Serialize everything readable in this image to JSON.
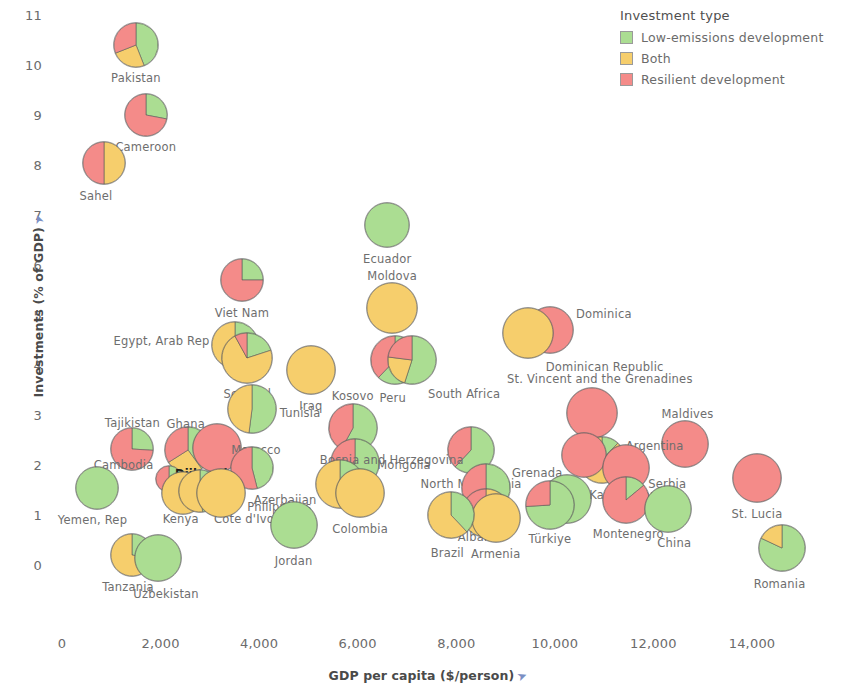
{
  "legend": {
    "title": "Investment type",
    "items": [
      {
        "label": "Low-emissions development",
        "color": "#abdd92",
        "key": "low"
      },
      {
        "label": "Both",
        "color": "#f6ce6c",
        "key": "both"
      },
      {
        "label": "Resilient development",
        "color": "#f48b89",
        "key": "resilient"
      }
    ]
  },
  "chart_data": {
    "type": "scatter",
    "marker": "pie",
    "title": "",
    "xlabel": "GDP per capita ($/person)",
    "ylabel": "Investments (% of GDP)",
    "xlim": [
      0,
      15200
    ],
    "ylim": [
      -0.45,
      11.3
    ],
    "xticks": [
      0,
      2000,
      4000,
      6000,
      8000,
      10000,
      12000,
      14000
    ],
    "xtick_labels": [
      "0",
      "2,000",
      "4,000",
      "6,000",
      "8,000",
      "10,000",
      "12,000",
      "14,000"
    ],
    "yticks": [
      0,
      1,
      2,
      3,
      4,
      5,
      6,
      7,
      8,
      9,
      10,
      11
    ],
    "ytick_labels": [
      "0",
      "1",
      "2",
      "3",
      "4",
      "5",
      "6",
      "7",
      "8",
      "9",
      "10",
      "11"
    ],
    "grid": false,
    "legend_position": "top-right",
    "slice_keys": [
      "low",
      "both",
      "resilient"
    ],
    "points": [
      {
        "name": "Pakistan",
        "x": 1500,
        "y": 10.4,
        "r": 23,
        "slices": {
          "low": 0.44,
          "both": 0.25,
          "resilient": 0.31
        },
        "label_dx": 0,
        "label_dy": 33,
        "align": "center"
      },
      {
        "name": "Cameroon",
        "x": 1700,
        "y": 9.0,
        "r": 22,
        "slices": {
          "low": 0.28,
          "both": 0.0,
          "resilient": 0.72
        },
        "label_dx": 0,
        "label_dy": 32,
        "align": "center"
      },
      {
        "name": "Sahel",
        "x": 850,
        "y": 8.05,
        "r": 22,
        "slices": {
          "low": 0.0,
          "both": 0.5,
          "resilient": 0.5
        },
        "label_dx": -8,
        "label_dy": 33,
        "align": "center"
      },
      {
        "name": "Ecuador",
        "x": 6600,
        "y": 6.8,
        "r": 23,
        "slices": {
          "low": 1.0,
          "both": 0.0,
          "resilient": 0.0
        },
        "label_dx": 0,
        "label_dy": 34,
        "align": "center"
      },
      {
        "name": "Viet Nam",
        "x": 3650,
        "y": 5.7,
        "r": 22,
        "slices": {
          "low": 0.25,
          "both": 0.0,
          "resilient": 0.75
        },
        "label_dx": 0,
        "label_dy": 33,
        "align": "center"
      },
      {
        "name": "Moldova",
        "x": 6700,
        "y": 5.15,
        "r": 26,
        "slices": {
          "low": 0.0,
          "both": 1.0,
          "resilient": 0.0
        },
        "label_dx": 0,
        "label_dy": -32,
        "align": "center"
      },
      {
        "name": "Dominica",
        "x": 9900,
        "y": 4.7,
        "r": 24,
        "slices": {
          "low": 0.0,
          "both": 0.0,
          "resilient": 1.0
        },
        "label_dx": 26,
        "label_dy": -16,
        "align": "left"
      },
      {
        "name": "Dominican Republic",
        "x": 9450,
        "y": 4.65,
        "r": 26,
        "slices": {
          "low": 0.0,
          "both": 1.0,
          "resilient": 0.0
        },
        "label_dx": 18,
        "label_dy": 34,
        "align": "left"
      },
      {
        "name": "Egypt, Arab Rep",
        "x": 3520,
        "y": 4.4,
        "r": 24,
        "slices": {
          "low": 0.22,
          "both": 0.78,
          "resilient": 0.0
        },
        "label_dx": -26,
        "label_dy": -4,
        "align": "right"
      },
      {
        "name": "Senegal",
        "x": 3760,
        "y": 4.15,
        "r": 26,
        "slices": {
          "low": 0.2,
          "both": 0.72,
          "resilient": 0.08
        },
        "label_dx": 0,
        "label_dy": 36,
        "align": "center"
      },
      {
        "name": "Peru",
        "x": 6750,
        "y": 4.1,
        "r": 25,
        "slices": {
          "low": 0.62,
          "both": 0.0,
          "resilient": 0.38
        },
        "label_dx": -2,
        "label_dy": 38,
        "align": "center"
      },
      {
        "name": "South Africa",
        "x": 7100,
        "y": 4.1,
        "r": 25,
        "slices": {
          "low": 0.55,
          "both": 0.22,
          "resilient": 0.23
        },
        "label_dx": 16,
        "label_dy": 34,
        "align": "left"
      },
      {
        "name": "Iraq",
        "x": 5050,
        "y": 3.9,
        "r": 25,
        "slices": {
          "low": 0.0,
          "both": 1.0,
          "resilient": 0.0
        },
        "label_dx": 0,
        "label_dy": 36,
        "align": "center"
      },
      {
        "name": "St. Vincent and the Grenadines",
        "x": 10750,
        "y": 3.05,
        "r": 26,
        "slices": {
          "low": 0.0,
          "both": 0.0,
          "resilient": 1.0
        },
        "label_dx": 8,
        "label_dy": -34,
        "align": "center"
      },
      {
        "name": "Tunisia",
        "x": 3850,
        "y": 3.12,
        "r": 25,
        "slices": {
          "low": 0.52,
          "both": 0.48,
          "resilient": 0.0
        },
        "label_dx": 28,
        "label_dy": 4,
        "align": "left"
      },
      {
        "name": "Kosovo",
        "x": 5900,
        "y": 2.75,
        "r": 25,
        "slices": {
          "low": 0.58,
          "both": 0.0,
          "resilient": 0.42
        },
        "label_dx": 0,
        "label_dy": -32,
        "align": "center"
      },
      {
        "name": "Tajikistan",
        "x": 1430,
        "y": 2.32,
        "r": 22,
        "slices": {
          "low": 0.26,
          "both": 0.0,
          "resilient": 0.74
        },
        "label_dx": 0,
        "label_dy": -26,
        "align": "center"
      },
      {
        "name": "Ghana",
        "x": 2550,
        "y": 2.3,
        "r": 24,
        "slices": {
          "low": 0.4,
          "both": 0.26,
          "resilient": 0.34
        },
        "label_dx": -2,
        "label_dy": -26,
        "align": "center"
      },
      {
        "name": "Morocco",
        "x": 3150,
        "y": 2.35,
        "r": 25,
        "slices": {
          "low": 0.0,
          "both": 0.0,
          "resilient": 1.0
        },
        "label_dx": 14,
        "label_dy": 2,
        "align": "left"
      },
      {
        "name": "Maldives",
        "x": 12650,
        "y": 2.43,
        "r": 24,
        "slices": {
          "low": 0.0,
          "both": 0.0,
          "resilient": 1.0
        },
        "label_dx": 2,
        "label_dy": -30,
        "align": "center"
      },
      {
        "name": "Argentina",
        "x": 10950,
        "y": 2.1,
        "r": 24,
        "slices": {
          "low": 0.12,
          "both": 0.88,
          "resilient": 0.0
        },
        "label_dx": 24,
        "label_dy": -14,
        "align": "left"
      },
      {
        "name": "Grenada",
        "x": 10600,
        "y": 2.2,
        "r": 23,
        "slices": {
          "low": 0.0,
          "both": 0.0,
          "resilient": 1.0
        },
        "label_dx": -22,
        "label_dy": 18,
        "align": "right"
      },
      {
        "name": "North Macedonia",
        "x": 8300,
        "y": 2.3,
        "r": 24,
        "slices": {
          "low": 0.62,
          "both": 0.0,
          "resilient": 0.38
        },
        "label_dx": 0,
        "label_dy": 34,
        "align": "center"
      },
      {
        "name": "Serbia",
        "x": 11450,
        "y": 1.95,
        "r": 24,
        "slices": {
          "low": 0.0,
          "both": 0.0,
          "resilient": 1.0
        },
        "label_dx": 22,
        "label_dy": 16,
        "align": "left"
      },
      {
        "name": "Cambodia",
        "x": 2180,
        "y": 1.73,
        "r": 14,
        "slices": {
          "low": 0.3,
          "both": 0.22,
          "resilient": 0.48
        },
        "label_dx": -16,
        "label_dy": -14,
        "align": "right"
      },
      {
        "name": "Djibouti",
        "x": 3850,
        "y": 1.95,
        "r": 22,
        "slices": {
          "low": 0.46,
          "both": 0.0,
          "resilient": 0.54
        },
        "label_dx": -24,
        "label_dy": 6,
        "align": "right"
      },
      {
        "name": "Mongolia",
        "x": 5950,
        "y": 2.05,
        "r": 25,
        "slices": {
          "low": 0.58,
          "both": 0.18,
          "resilient": 0.24
        },
        "label_dx": 22,
        "label_dy": 2,
        "align": "left"
      },
      {
        "name": "St. Lucia",
        "x": 14100,
        "y": 1.75,
        "r": 25,
        "slices": {
          "low": 0.0,
          "both": 0.0,
          "resilient": 1.0
        },
        "label_dx": 0,
        "label_dy": 36,
        "align": "center"
      },
      {
        "name": "Bosnia and Herzegovina",
        "x": 8600,
        "y": 1.55,
        "r": 25,
        "slices": {
          "low": 0.44,
          "both": 0.0,
          "resilient": 0.56
        },
        "label_dx": -22,
        "label_dy": -28,
        "align": "right"
      },
      {
        "name": "Azerbaijan",
        "x": 5650,
        "y": 1.62,
        "r": 25,
        "slices": {
          "low": 0.28,
          "both": 0.72,
          "resilient": 0.0
        },
        "label_dx": -24,
        "label_dy": 16,
        "align": "right"
      },
      {
        "name": "Kenya",
        "x": 2450,
        "y": 1.45,
        "r": 22,
        "slices": {
          "low": 0.0,
          "both": 1.0,
          "resilient": 0.0
        },
        "label_dx": -2,
        "label_dy": 26,
        "align": "center"
      },
      {
        "name": "Côte d'Ivoire",
        "x": 2800,
        "y": 1.48,
        "r": 22,
        "slices": {
          "low": 0.48,
          "both": 0.52,
          "resilient": 0.0
        },
        "label_dx": 14,
        "label_dy": 28,
        "align": "left"
      },
      {
        "name": "Philippines",
        "x": 3230,
        "y": 1.45,
        "r": 25,
        "slices": {
          "low": 0.0,
          "both": 1.0,
          "resilient": 0.0
        },
        "label_dx": 26,
        "label_dy": 14,
        "align": "left"
      },
      {
        "name": "Yemen, Rep",
        "x": 700,
        "y": 1.55,
        "r": 22,
        "slices": {
          "low": 1.0,
          "both": 0.0,
          "resilient": 0.0
        },
        "label_dx": -4,
        "label_dy": 32,
        "align": "center"
      },
      {
        "name": "Kazakhstan",
        "x": 10250,
        "y": 1.32,
        "r": 25,
        "slices": {
          "low": 1.0,
          "both": 0.0,
          "resilient": 0.0
        },
        "label_dx": 22,
        "label_dy": -4,
        "align": "left"
      },
      {
        "name": "Türkiye",
        "x": 9900,
        "y": 1.2,
        "r": 25,
        "slices": {
          "low": 0.74,
          "both": 0.0,
          "resilient": 0.26
        },
        "label_dx": 0,
        "label_dy": 34,
        "align": "center"
      },
      {
        "name": "Colombia",
        "x": 6050,
        "y": 1.45,
        "r": 25,
        "slices": {
          "low": 0.0,
          "both": 1.0,
          "resilient": 0.0
        },
        "label_dx": 0,
        "label_dy": 36,
        "align": "center"
      },
      {
        "name": "Montenegro",
        "x": 11450,
        "y": 1.3,
        "r": 24,
        "slices": {
          "low": 0.14,
          "both": 0.0,
          "resilient": 0.86
        },
        "label_dx": 2,
        "label_dy": 34,
        "align": "center"
      },
      {
        "name": "China",
        "x": 12300,
        "y": 1.12,
        "r": 24,
        "slices": {
          "low": 1.0,
          "both": 0.0,
          "resilient": 0.0
        },
        "label_dx": 6,
        "label_dy": 34,
        "align": "center"
      },
      {
        "name": "Albania",
        "x": 8600,
        "y": 1.05,
        "r": 25,
        "slices": {
          "low": 0.0,
          "both": 0.74,
          "resilient": 0.26
        },
        "label_dx": -6,
        "label_dy": 24,
        "align": "center"
      },
      {
        "name": "Armenia",
        "x": 8800,
        "y": 0.95,
        "r": 25,
        "slices": {
          "low": 0.0,
          "both": 1.0,
          "resilient": 0.0
        },
        "label_dx": 0,
        "label_dy": 36,
        "align": "center"
      },
      {
        "name": "Brazil",
        "x": 7900,
        "y": 1.0,
        "r": 24,
        "slices": {
          "low": 0.38,
          "both": 0.62,
          "resilient": 0.0
        },
        "label_dx": -4,
        "label_dy": 38,
        "align": "center"
      },
      {
        "name": "Jordan",
        "x": 4700,
        "y": 0.8,
        "r": 24,
        "slices": {
          "low": 1.0,
          "both": 0.0,
          "resilient": 0.0
        },
        "label_dx": 0,
        "label_dy": 36,
        "align": "center"
      },
      {
        "name": "Romania",
        "x": 14600,
        "y": 0.35,
        "r": 24,
        "slices": {
          "low": 0.82,
          "both": 0.18,
          "resilient": 0.0
        },
        "label_dx": -2,
        "label_dy": 36,
        "align": "center"
      },
      {
        "name": "Tanzania",
        "x": 1420,
        "y": 0.2,
        "r": 22,
        "slices": {
          "low": 0.28,
          "both": 0.72,
          "resilient": 0.0
        },
        "label_dx": -4,
        "label_dy": 32,
        "align": "center"
      },
      {
        "name": "Uzbekistan",
        "x": 1950,
        "y": 0.15,
        "r": 24,
        "slices": {
          "low": 1.0,
          "both": 0.0,
          "resilient": 0.0
        },
        "label_dx": 8,
        "label_dy": 36,
        "align": "center"
      }
    ]
  }
}
